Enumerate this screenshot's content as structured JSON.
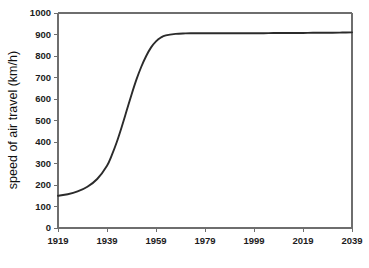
{
  "chart_data": {
    "type": "line",
    "title": "",
    "xlabel": "",
    "ylabel": "speed of air travel (km/h)",
    "xlim": [
      1919,
      2039
    ],
    "ylim": [
      0,
      1000
    ],
    "grid": false,
    "legend": null,
    "x_ticks": [
      1919,
      1939,
      1959,
      1979,
      1999,
      2019,
      2039
    ],
    "x_tick_labels": [
      "1919",
      "1939",
      "1959",
      "1979",
      "1999",
      "2019",
      "2039"
    ],
    "y_ticks": [
      0,
      100,
      200,
      300,
      400,
      500,
      600,
      700,
      800,
      900,
      1000
    ],
    "y_tick_labels": [
      "0",
      "100",
      "200",
      "300",
      "400",
      "500",
      "600",
      "700",
      "800",
      "900",
      "1000"
    ],
    "series": [
      {
        "name": "speed of air travel",
        "color": "#2b2b2b",
        "x": [
          1919,
          1923,
          1927,
          1931,
          1935,
          1939,
          1941,
          1943,
          1945,
          1947,
          1949,
          1951,
          1953,
          1955,
          1957,
          1959,
          1961,
          1963,
          1967,
          1971,
          1975,
          1979,
          1983,
          1987,
          1991,
          1995,
          1999,
          2003,
          2007,
          2011,
          2015,
          2019,
          2023,
          2027,
          2031,
          2035,
          2039
        ],
        "y": [
          150,
          157,
          170,
          192,
          228,
          290,
          340,
          400,
          470,
          545,
          620,
          690,
          750,
          800,
          840,
          868,
          886,
          896,
          903,
          905,
          906,
          906,
          906,
          906,
          906,
          906,
          906,
          906,
          907,
          907,
          907,
          907,
          908,
          908,
          908,
          909,
          910
        ]
      }
    ]
  },
  "axes": {
    "y_axis_title": "speed of air travel (km/h)"
  }
}
